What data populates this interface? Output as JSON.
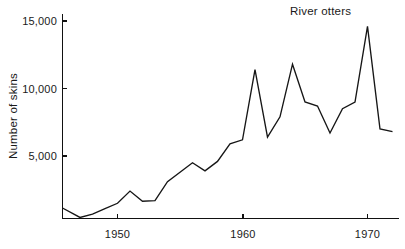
{
  "chart_data": {
    "type": "line",
    "title": "River otters",
    "xlabel": "",
    "ylabel": "Number of skins",
    "xlim": [
      1945.6,
      1972.2
    ],
    "ylim": [
      0,
      15800
    ],
    "grid": false,
    "legend": null,
    "xticks": [
      1950,
      1960,
      1970
    ],
    "xticklabels": [
      "1950",
      "1960",
      "1970"
    ],
    "yticks": [
      5000,
      10000,
      15000
    ],
    "yticklabels": [
      "5,000",
      "10,000",
      "15,000"
    ],
    "series": [
      {
        "name": "River otters",
        "x": [
          1945.6,
          1947,
          1948,
          1949,
          1950,
          1951,
          1952,
          1953,
          1954,
          1955,
          1956,
          1957,
          1958,
          1959,
          1960,
          1961,
          1962,
          1963,
          1964,
          1965,
          1966,
          1967,
          1968,
          1969,
          1970,
          1971,
          1972
        ],
        "values": [
          1150,
          450,
          700,
          1100,
          1500,
          2400,
          1650,
          1700,
          3100,
          3800,
          4500,
          3900,
          4600,
          5900,
          6200,
          11400,
          6400,
          7900,
          11800,
          9000,
          8700,
          6700,
          8500,
          9000,
          14600,
          7000,
          6800
        ]
      }
    ],
    "annotations": [
      {
        "text": "River otters",
        "x": 1967.2,
        "y": 15700
      }
    ]
  },
  "axes": {
    "y_axis_label": "Number of skins",
    "y_tick_labels": [
      "15,000",
      "10,000",
      "5,000"
    ],
    "x_tick_labels": [
      "1950",
      "1960",
      "1970"
    ]
  },
  "title": {
    "text": "River otters"
  }
}
